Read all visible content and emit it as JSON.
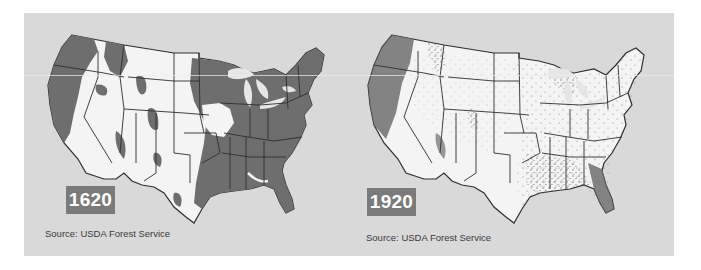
{
  "figure": {
    "colors": {
      "background": "#d9d9d9",
      "land": "#f4f4f4",
      "forest": "#6e6e6e",
      "state_border": "#2e2e2e",
      "badge": "#7a7a7a"
    },
    "panels": [
      {
        "year": "1620",
        "source": "Source: USDA Forest Service",
        "forest_pattern": "solid dense forest over most of the eastern half and Pacific Northwest"
      },
      {
        "year": "1920",
        "source": "Source: USDA Forest Service",
        "forest_pattern": "scattered stippled remnants; denser in Pacific Northwest, Great Lakes, Southeast, and Florida"
      }
    ]
  }
}
